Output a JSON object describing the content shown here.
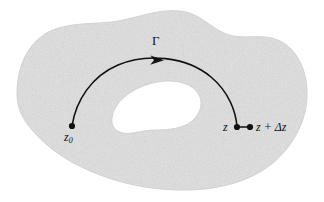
{
  "figure": {
    "kind": "complex-analysis-contour-diagram",
    "caption_text": "",
    "colors": {
      "region_fill": "#e2e2e2",
      "region_edge": "#d5d5d5",
      "hole_fill": "#ffffff",
      "curve": "#111111",
      "point": "#111111",
      "background": "#ffffff",
      "text": "#111111"
    },
    "labels": {
      "start_point": "z",
      "start_point_subscript": "0",
      "end_point": "z",
      "increment_point": "z + Δz",
      "contour": "Γ"
    },
    "points": [
      {
        "name": "z0",
        "label": "z0",
        "x": 72,
        "y": 126,
        "radius": 3.1
      },
      {
        "name": "z",
        "label": "z",
        "x": 237,
        "y": 127,
        "radius": 3.1
      },
      {
        "name": "z+dz",
        "label": "z + Δz",
        "x": 250,
        "y": 127,
        "radius": 3.1
      }
    ],
    "contour": {
      "name": "Gamma",
      "from": "z0",
      "to": "z",
      "arrow_at": {
        "x": 160,
        "y": 60
      },
      "stroke_width": 1.6,
      "path": "M 72 126 C 76 100, 92 76, 118 65 C 146 53, 186 56, 211 77 C 229 92, 236 112, 237 127"
    },
    "segment": {
      "name": "delta-z-segment",
      "from": "z",
      "to": "z+dz",
      "stroke_width": 1.7,
      "path": "M 237 127 L 250 127"
    },
    "outer_boundary": {
      "name": "domain-outer-boundary",
      "path": "M 17 94 C 17 70, 25 47, 45 34 C 66 21, 96 25, 118 21 C 140 17, 158 9, 180 11 C 200 13, 209 27, 226 34 C 244 41, 262 32, 280 41 C 298 50, 308 72, 307 97 C 306 122, 293 146, 273 163 C 251 181, 221 189, 190 190 C 157 191, 126 185, 100 175 C 73 165, 49 150, 33 131 C 22 119, 17 107, 17 94 Z"
    },
    "hole_boundary": {
      "name": "domain-hole-boundary",
      "path": "M 112 119 C 113 105, 126 92, 146 85 C 166 78, 188 80, 197 92 C 205 102, 200 114, 192 121 C 184 128, 170 130, 156 130 C 142 130, 131 135, 123 133 C 115 131, 111 126, 112 119 Z"
    }
  }
}
